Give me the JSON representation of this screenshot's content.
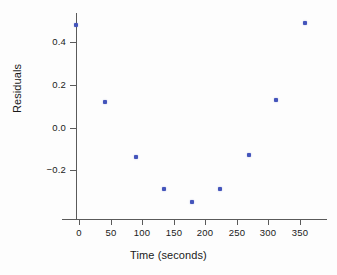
{
  "chart_data": {
    "type": "scatter",
    "title": "",
    "xlabel": "Time (seconds)",
    "ylabel": "Residuals",
    "xlim": [
      -22,
      394
    ],
    "ylim": [
      -0.44,
      0.55
    ],
    "grid": false,
    "legend": "none",
    "marker_color": "#4455bb",
    "axis_color": "#5a5a5a",
    "xticks": [
      0,
      50,
      100,
      150,
      200,
      250,
      300,
      350
    ],
    "xtick_labels": [
      "0",
      "50",
      "100",
      "150",
      "200",
      "250",
      "300",
      "350"
    ],
    "yticks": [
      0.4,
      0.2,
      0.0,
      -0.2
    ],
    "ytick_labels": [
      "0.4",
      "0.2",
      "0.0",
      "−0.2"
    ],
    "x": [
      -5,
      41,
      90,
      135,
      179,
      223,
      269,
      312,
      358
    ],
    "y": [
      0.48,
      0.12,
      -0.14,
      -0.29,
      -0.35,
      -0.29,
      -0.13,
      0.13,
      0.49
    ],
    "points": [
      {
        "x": -5,
        "y": 0.48
      },
      {
        "x": 41,
        "y": 0.12
      },
      {
        "x": 90,
        "y": -0.14
      },
      {
        "x": 135,
        "y": -0.29
      },
      {
        "x": 179,
        "y": -0.35
      },
      {
        "x": 223,
        "y": -0.29
      },
      {
        "x": 269,
        "y": -0.13
      },
      {
        "x": 312,
        "y": 0.13
      },
      {
        "x": 358,
        "y": 0.49
      }
    ]
  }
}
